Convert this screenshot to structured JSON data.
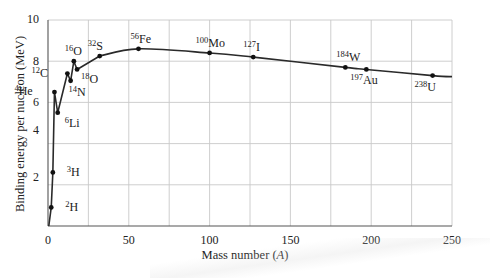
{
  "chart_data": {
    "type": "line",
    "title": "",
    "xlabel": "Mass number (A)",
    "ylabel": "Binding energy per nucleon (MeV)",
    "xlim": [
      0,
      250
    ],
    "ylim": [
      0,
      10
    ],
    "x_ticks": [
      0,
      50,
      100,
      150,
      200,
      250
    ],
    "y_ticks": [
      2,
      4,
      6,
      8,
      10
    ],
    "x_grid_step": 25,
    "y_grid_step": 2,
    "grid": true,
    "legend": null,
    "series": [
      {
        "name": "Binding energy per nucleon",
        "points": [
          {
            "label": "2H",
            "mass": "2",
            "symbol": "H",
            "x": 2,
            "y": 0.9
          },
          {
            "label": "3H",
            "mass": "3",
            "symbol": "H",
            "x": 3,
            "y": 2.6
          },
          {
            "label": "4He",
            "mass": "4",
            "symbol": "He",
            "x": 4,
            "y": 6.5
          },
          {
            "label": "6Li",
            "mass": "6",
            "symbol": "Li",
            "x": 6,
            "y": 5.5
          },
          {
            "label": "12C",
            "mass": "12",
            "symbol": "C",
            "x": 12,
            "y": 7.4
          },
          {
            "label": "14N",
            "mass": "14",
            "symbol": "N",
            "x": 14,
            "y": 7.05
          },
          {
            "label": "16O",
            "mass": "16",
            "symbol": "O",
            "x": 16,
            "y": 8.0
          },
          {
            "label": "18O",
            "mass": "18",
            "symbol": "O",
            "x": 18,
            "y": 7.6
          },
          {
            "label": "32S",
            "mass": "32",
            "symbol": "S",
            "x": 32,
            "y": 8.25
          },
          {
            "label": "56Fe",
            "mass": "56",
            "symbol": "Fe",
            "x": 56,
            "y": 8.6
          },
          {
            "label": "100Mo",
            "mass": "100",
            "symbol": "Mo",
            "x": 100,
            "y": 8.4
          },
          {
            "label": "127I",
            "mass": "127",
            "symbol": "I",
            "x": 127,
            "y": 8.2
          },
          {
            "label": "184W",
            "mass": "184",
            "symbol": "W",
            "x": 184,
            "y": 7.7
          },
          {
            "label": "197Au",
            "mass": "197",
            "symbol": "Au",
            "x": 197,
            "y": 7.6
          },
          {
            "label": "238U",
            "mass": "238",
            "symbol": "U",
            "x": 238,
            "y": 7.3
          }
        ]
      }
    ],
    "curve_end": {
      "x": 250,
      "y": 7.25
    }
  },
  "labels": {
    "xlabel_text": "Mass number (",
    "xlabel_var": "A",
    "xlabel_close": ")",
    "ylabel": "Binding energy per nucleon (MeV)"
  }
}
